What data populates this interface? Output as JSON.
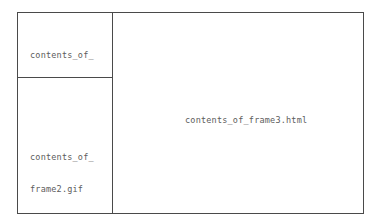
{
  "diagram": {
    "border_color": "#4a4a4a",
    "text_color": "#5c5c5c",
    "background_color": "#ffffff",
    "frames": [
      {
        "id": "frame1",
        "position": "top-left",
        "lines": [
          "contents_of_",
          "frame1.html"
        ],
        "text_align": "left"
      },
      {
        "id": "frame2",
        "position": "bottom-left",
        "lines": [
          "contents_of_",
          "frame2.gif"
        ],
        "text_align": "left"
      },
      {
        "id": "frame3",
        "position": "right",
        "lines": [
          "contents_of_frame3.html"
        ],
        "text_align": "center"
      }
    ]
  }
}
